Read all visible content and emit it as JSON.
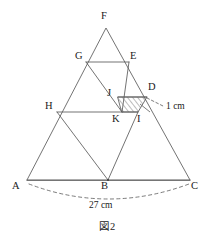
{
  "figure": {
    "caption": "図2",
    "vertex_labels": [
      {
        "name": "F",
        "text": "F",
        "lx": 101,
        "ly": 11
      },
      {
        "name": "G",
        "text": "G",
        "lx": 75,
        "ly": 51
      },
      {
        "name": "E",
        "text": "E",
        "lx": 130,
        "ly": 51
      },
      {
        "name": "J",
        "text": "J",
        "lx": 107,
        "ly": 88
      },
      {
        "name": "D",
        "text": "D",
        "lx": 148,
        "ly": 82
      },
      {
        "name": "H",
        "text": "H",
        "lx": 45,
        "ly": 101
      },
      {
        "name": "K",
        "text": "K",
        "lx": 112,
        "ly": 114
      },
      {
        "name": "I",
        "text": "I",
        "lx": 137,
        "ly": 114
      },
      {
        "name": "A",
        "text": "A",
        "lx": 12,
        "ly": 181
      },
      {
        "name": "B",
        "text": "B",
        "lx": 101,
        "ly": 181
      },
      {
        "name": "C",
        "text": "C",
        "lx": 191,
        "ly": 181
      }
    ],
    "dimensions": [
      {
        "name": "side-dimension",
        "text": "1 cm",
        "lx": 166,
        "ly": 102
      },
      {
        "name": "base-dimension",
        "text": "27 cm",
        "lx": 89,
        "ly": 201
      }
    ],
    "points": {
      "A": [
        27,
        180
      ],
      "B": [
        108,
        180
      ],
      "C": [
        190,
        180
      ],
      "F": [
        106,
        28
      ],
      "G": [
        86,
        62
      ],
      "E": [
        129,
        62
      ],
      "H": [
        57,
        112
      ],
      "I": [
        138,
        112
      ],
      "J": [
        118,
        97
      ],
      "D": [
        147,
        97
      ],
      "K": [
        122,
        112
      ]
    },
    "colors": {
      "stroke": "#5a5a5a",
      "hatch": "#6a6a6a",
      "text": "#1a1a1a",
      "background": "#ffffff"
    },
    "shaded_region": {
      "name": "parallelogram-JDIK",
      "vertices": [
        "J",
        "D",
        "I",
        "K"
      ],
      "fill": "hatched"
    }
  }
}
